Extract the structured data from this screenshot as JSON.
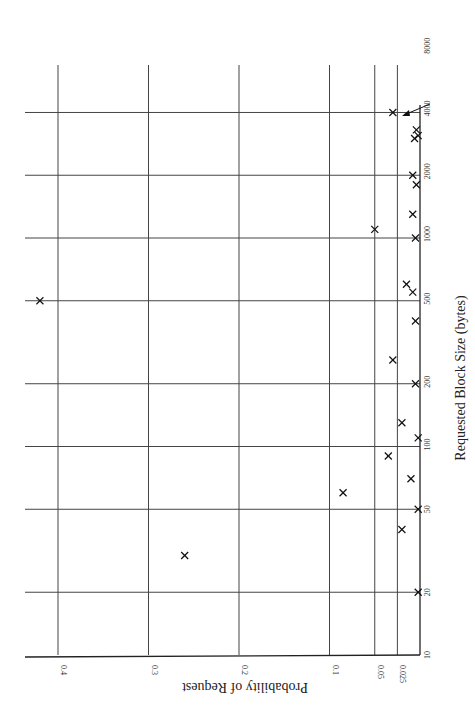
{
  "chart_data": {
    "type": "scatter",
    "orientation": "rotated-90",
    "title": "",
    "xlabel": "Requested Block Size (bytes)",
    "ylabel": "Probability of Request",
    "x_scale": "log",
    "x_ticks": [
      10,
      20,
      50,
      100,
      200,
      500,
      1000,
      2000,
      4000,
      8000
    ],
    "y_ticks": [
      0.025,
      0.05,
      0.1,
      0.2,
      0.3,
      0.4
    ],
    "x_range": [
      10,
      8000
    ],
    "y_range": [
      0,
      0.42
    ],
    "grid": true,
    "annotation": "arrow pointing to point at 4000",
    "points": [
      {
        "x": 20,
        "y": 0.002
      },
      {
        "x": 30,
        "y": 0.26
      },
      {
        "x": 40,
        "y": 0.02
      },
      {
        "x": 50,
        "y": 0.002
      },
      {
        "x": 60,
        "y": 0.085
      },
      {
        "x": 70,
        "y": 0.01
      },
      {
        "x": 90,
        "y": 0.035
      },
      {
        "x": 110,
        "y": 0.002
      },
      {
        "x": 130,
        "y": 0.02
      },
      {
        "x": 200,
        "y": 0.005
      },
      {
        "x": 260,
        "y": 0.03
      },
      {
        "x": 400,
        "y": 0.005
      },
      {
        "x": 550,
        "y": 0.008
      },
      {
        "x": 600,
        "y": 0.015
      },
      {
        "x": 500,
        "y": 0.42
      },
      {
        "x": 1000,
        "y": 0.005
      },
      {
        "x": 1100,
        "y": 0.05
      },
      {
        "x": 1300,
        "y": 0.008
      },
      {
        "x": 1800,
        "y": 0.004
      },
      {
        "x": 2000,
        "y": 0.008
      },
      {
        "x": 3000,
        "y": 0.006
      },
      {
        "x": 3100,
        "y": 0.002
      },
      {
        "x": 3300,
        "y": 0.004
      },
      {
        "x": 4000,
        "y": 0.03
      }
    ]
  }
}
